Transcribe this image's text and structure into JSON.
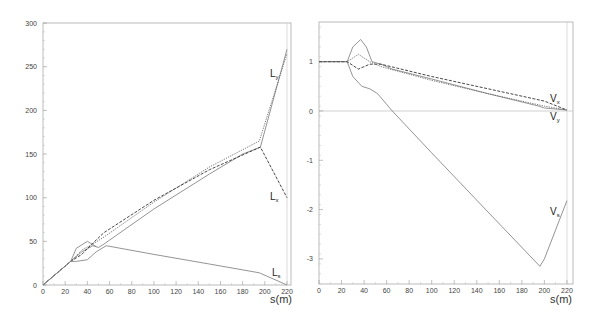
{
  "chart_data": [
    {
      "type": "line",
      "title": "",
      "xlabel": "s(m)",
      "ylabel": "",
      "xlim": [
        0,
        222
      ],
      "ylim": [
        0,
        300
      ],
      "xticks": [
        "0",
        "20",
        "40",
        "60",
        "80",
        "100",
        "120",
        "140",
        "160",
        "180",
        "200",
        "220"
      ],
      "yticks": [
        "0",
        "50",
        "100",
        "150",
        "200",
        "250",
        "300"
      ],
      "grid": false,
      "legend": "inline curve labels",
      "annotations": [
        "Ly",
        "Lx",
        "Ls"
      ],
      "series": [
        {
          "name": "Ly (solid)",
          "style": "solid",
          "x": [
            0,
            25,
            35,
            45,
            50,
            55,
            100,
            150,
            180,
            196,
            220
          ],
          "y": [
            0,
            27,
            38,
            45,
            43,
            47,
            87,
            127,
            150,
            158,
            270
          ]
        },
        {
          "name": "Ly (dotted)",
          "style": "dotted",
          "x": [
            0,
            25,
            35,
            45,
            55,
            100,
            150,
            195,
            220
          ],
          "y": [
            0,
            27,
            40,
            47,
            55,
            95,
            135,
            165,
            265
          ]
        },
        {
          "name": "Lx (dashed)",
          "style": "dashed",
          "x": [
            0,
            25,
            35,
            45,
            55,
            100,
            150,
            196,
            220
          ],
          "y": [
            0,
            27,
            35,
            48,
            60,
            97,
            132,
            158,
            100
          ]
        },
        {
          "name": "Ls (solid)",
          "style": "solid",
          "x": [
            0,
            25,
            30,
            40,
            48,
            57,
            100,
            150,
            195,
            220
          ],
          "y": [
            0,
            27,
            27,
            29,
            38,
            45,
            35,
            24,
            14,
            0
          ]
        },
        {
          "name": "loop (solid upper)",
          "style": "solid",
          "x": [
            25,
            30,
            40,
            48
          ],
          "y": [
            27,
            42,
            50,
            44
          ]
        }
      ]
    },
    {
      "type": "line",
      "title": "",
      "xlabel": "s(m)",
      "ylabel": "",
      "xlim": [
        0,
        222
      ],
      "ylim": [
        -3.5,
        1.8
      ],
      "xticks": [
        "0",
        "20",
        "40",
        "60",
        "80",
        "100",
        "120",
        "140",
        "160",
        "180",
        "200",
        "220"
      ],
      "yticks": [
        "-3",
        "-2",
        "-1",
        "0",
        "1"
      ],
      "grid": false,
      "reference_line": 0,
      "annotations": [
        "Vx",
        "Vy",
        "Vs"
      ],
      "series": [
        {
          "name": "Vs (solid)",
          "style": "solid",
          "x": [
            0,
            25,
            30,
            37,
            42,
            47,
            55,
            65,
            100,
            150,
            195,
            200,
            220
          ],
          "y": [
            1,
            1,
            1.3,
            1.45,
            1.3,
            1.0,
            0.95,
            0.85,
            0.65,
            0.35,
            0.1,
            0.06,
            0.02
          ]
        },
        {
          "name": "Vs lower (solid)",
          "style": "solid",
          "x": [
            25,
            30,
            38,
            45,
            52,
            65,
            100,
            150,
            196,
            200,
            220
          ],
          "y": [
            1,
            0.7,
            0.5,
            0.45,
            0.35,
            0.0,
            -0.85,
            -2.05,
            -3.15,
            -3.0,
            -1.82
          ]
        },
        {
          "name": "Vx (dashed)",
          "style": "dashed",
          "x": [
            0,
            25,
            35,
            45,
            55,
            100,
            150,
            200,
            220
          ],
          "y": [
            1,
            1,
            0.85,
            0.95,
            0.95,
            0.7,
            0.45,
            0.2,
            0.02
          ]
        },
        {
          "name": "Vy (dotted)",
          "style": "dotted",
          "x": [
            0,
            25,
            35,
            45,
            55,
            100,
            150,
            200,
            220
          ],
          "y": [
            1,
            1,
            1.15,
            1.0,
            0.9,
            0.62,
            0.35,
            0.1,
            0.02
          ]
        }
      ]
    }
  ],
  "left_plot": {
    "xlabel": "s(m)",
    "labels": {
      "ly_main": "L",
      "ly_sub": "y",
      "lx_main": "L",
      "lx_sub": "x",
      "ls_main": "L",
      "ls_sub": "s"
    }
  },
  "right_plot": {
    "xlabel": "s(m)",
    "labels": {
      "vx_main": "V",
      "vx_sub": "x",
      "vy_main": "V",
      "vy_sub": "y",
      "vs_main": "V",
      "vs_sub": "s"
    }
  }
}
